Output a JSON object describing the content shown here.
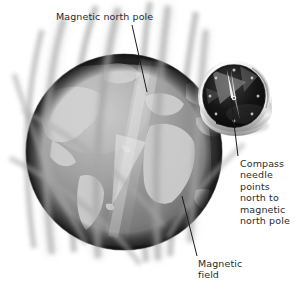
{
  "figure": {
    "background_color": "#ffffff",
    "width": 303,
    "height": 293
  },
  "labels": {
    "magnetic_north_pole": "Magnetic north pole",
    "compass_needle": "Compass\nneedle\npoints\nnorth to\nmagnetic\nnorth pole",
    "magnetic_field": "Magnetic\nfield"
  },
  "colors": {
    "text": "#2b2b2b",
    "leader_line": "#1c1c1c",
    "globe_dark": "#1f1f1f",
    "globe_mid": "#8d8d8d",
    "globe_light": "#d9d9d9",
    "ocean": "#9a9a9a",
    "land": "#cfcfcf",
    "field_line": "#a8a8a8",
    "compass_rim": "#e2e2e2",
    "compass_face": "#141414",
    "compass_needle": "#f2f2f2"
  },
  "elements": {
    "globe": {
      "name": "earth-globe",
      "center_x": 124,
      "center_y": 152,
      "radius": 98
    },
    "compass": {
      "name": "compass",
      "center_x": 234,
      "center_y": 98,
      "radius": 36,
      "needle_direction": "north-west"
    },
    "field_lines_count": 14
  },
  "leaders": [
    {
      "name": "leader-magnetic-north-pole",
      "x1": 132,
      "y1": 26,
      "x2": 147,
      "y2": 90
    },
    {
      "name": "leader-compass-needle",
      "x1": 237,
      "y1": 155,
      "x2": 231,
      "y2": 100
    },
    {
      "name": "leader-magnetic-field",
      "x1": 197,
      "y1": 256,
      "x2": 183,
      "y2": 198
    }
  ]
}
